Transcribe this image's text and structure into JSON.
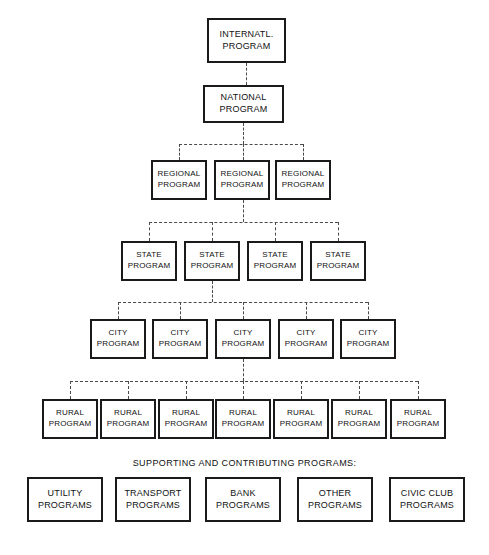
{
  "diagram": {
    "title_visible": false,
    "background_color": "#ffffff",
    "box_border_color": "#1a1a1a",
    "connector_color": "#4a4a4a",
    "connector_style": "dashed",
    "levels": [
      {
        "level_name": "international",
        "count": 1,
        "nodes": [
          {
            "line1": "INTERNATL.",
            "line2": "PROGRAM"
          }
        ]
      },
      {
        "level_name": "national",
        "count": 1,
        "nodes": [
          {
            "line1": "NATIONAL",
            "line2": "PROGRAM"
          }
        ]
      },
      {
        "level_name": "regional",
        "count": 3,
        "nodes": [
          {
            "line1": "REGIONAL",
            "line2": "PROGRAM"
          },
          {
            "line1": "REGIONAL",
            "line2": "PROGRAM"
          },
          {
            "line1": "REGIONAL",
            "line2": "PROGRAM"
          }
        ]
      },
      {
        "level_name": "state",
        "count": 4,
        "nodes": [
          {
            "line1": "STATE",
            "line2": "PROGRAM"
          },
          {
            "line1": "STATE",
            "line2": "PROGRAM"
          },
          {
            "line1": "STATE",
            "line2": "PROGRAM"
          },
          {
            "line1": "STATE",
            "line2": "PROGRAM"
          }
        ]
      },
      {
        "level_name": "city",
        "count": 5,
        "nodes": [
          {
            "line1": "CITY",
            "line2": "PROGRAM"
          },
          {
            "line1": "CITY",
            "line2": "PROGRAM"
          },
          {
            "line1": "CITY",
            "line2": "PROGRAM"
          },
          {
            "line1": "CITY",
            "line2": "PROGRAM"
          },
          {
            "line1": "CITY",
            "line2": "PROGRAM"
          }
        ]
      },
      {
        "level_name": "rural",
        "count": 7,
        "nodes": [
          {
            "line1": "RURAL",
            "line2": "PROGRAM"
          },
          {
            "line1": "RURAL",
            "line2": "PROGRAM"
          },
          {
            "line1": "RURAL",
            "line2": "PROGRAM"
          },
          {
            "line1": "RURAL",
            "line2": "PROGRAM"
          },
          {
            "line1": "RURAL",
            "line2": "PROGRAM"
          },
          {
            "line1": "RURAL",
            "line2": "PROGRAM"
          },
          {
            "line1": "RURAL",
            "line2": "PROGRAM"
          }
        ]
      }
    ],
    "supporting_section": {
      "heading": "SUPPORTING AND CONTRIBUTING PROGRAMS:",
      "count": 5,
      "nodes": [
        {
          "line1": "UTILITY",
          "line2": "PROGRAMS"
        },
        {
          "line1": "TRANSPORT",
          "line2": "PROGRAMS"
        },
        {
          "line1": "BANK",
          "line2": "PROGRAMS"
        },
        {
          "line1": "OTHER",
          "line2": "PROGRAMS"
        },
        {
          "line1": "CIVIC CLUB",
          "line2": "PROGRAMS"
        }
      ]
    }
  }
}
